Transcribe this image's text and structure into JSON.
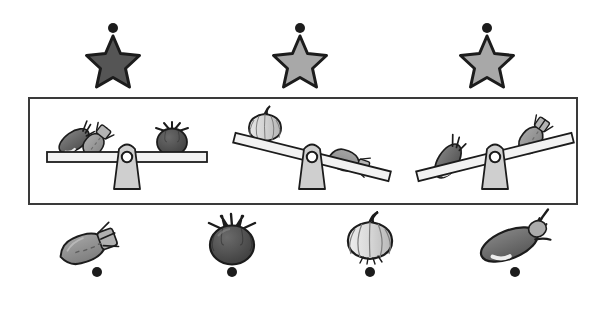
{
  "canvas": {
    "width": 608,
    "height": 313,
    "background": "#ffffff"
  },
  "palette": {
    "outline": "#1c1c1c",
    "panel_border": "#3a3a3a",
    "dot": "#1c1c1c",
    "star_dark": "#555555",
    "star_light": "#a8a8a8",
    "beam_fill": "#f2f2f2",
    "fulcrum_fill": "#cfcfcf",
    "carrot_fill": "#8c8c8c",
    "carrot_top": "#a8a8a8",
    "tomato_fill": "#4a4a4a",
    "onion_fill": "#d0d0d0",
    "eggplant_fill": "#6e6e6e"
  },
  "markers": {
    "top_row": [
      {
        "id": "marker-top-1",
        "x": 113,
        "y": 28,
        "r": 5
      },
      {
        "id": "marker-top-2",
        "x": 300,
        "y": 28,
        "r": 5
      },
      {
        "id": "marker-top-3",
        "x": 487,
        "y": 28,
        "r": 5
      }
    ],
    "bottom_row": [
      {
        "id": "marker-bottom-1",
        "x": 97,
        "y": 272,
        "r": 5
      },
      {
        "id": "marker-bottom-2",
        "x": 232,
        "y": 272,
        "r": 5
      },
      {
        "id": "marker-bottom-3",
        "x": 370,
        "y": 272,
        "r": 5
      },
      {
        "id": "marker-bottom-4",
        "x": 515,
        "y": 272,
        "r": 5
      }
    ]
  },
  "stars": [
    {
      "id": "star-1",
      "cx": 113,
      "cy": 62,
      "r": 26,
      "shade": "dark",
      "fill": "#555555"
    },
    {
      "id": "star-2",
      "cx": 300,
      "cy": 62,
      "r": 26,
      "shade": "light",
      "fill": "#a8a8a8"
    },
    {
      "id": "star-3",
      "cx": 487,
      "cy": 62,
      "r": 26,
      "shade": "light",
      "fill": "#a8a8a8"
    }
  ],
  "panel": {
    "x": 28,
    "y": 97,
    "width": 550,
    "height": 108,
    "border_color": "#3a3a3a",
    "border_width": 2
  },
  "balances": [
    {
      "id": "balance-1",
      "pivot_x": 113,
      "pivot_y": 168,
      "tilt_degrees": 0,
      "state": "balanced",
      "left_items": [
        "eggplant",
        "carrot"
      ],
      "right_items": [
        "tomato"
      ]
    },
    {
      "id": "balance-2",
      "pivot_x": 300,
      "pivot_y": 168,
      "tilt_degrees": 14,
      "state": "right-heavier",
      "left_items": [
        "onion"
      ],
      "right_items": [
        "carrot"
      ]
    },
    {
      "id": "balance-3",
      "pivot_x": 487,
      "pivot_y": 168,
      "tilt_degrees": -14,
      "state": "left-heavier",
      "left_items": [
        "eggplant"
      ],
      "right_items": [
        "carrot"
      ]
    }
  ],
  "vegetables": [
    {
      "id": "veg-carrot",
      "name": "carrot",
      "cx": 97,
      "cy": 243,
      "fill": "#8c8c8c"
    },
    {
      "id": "veg-tomato",
      "name": "tomato",
      "cx": 232,
      "cy": 243,
      "fill": "#4a4a4a"
    },
    {
      "id": "veg-onion",
      "name": "onion",
      "cx": 370,
      "cy": 243,
      "fill": "#d0d0d0"
    },
    {
      "id": "veg-eggplant",
      "name": "eggplant",
      "cx": 515,
      "cy": 243,
      "fill": "#6e6e6e"
    }
  ]
}
